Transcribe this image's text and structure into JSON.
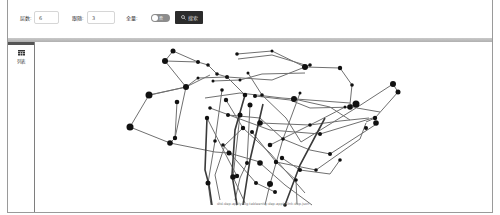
{
  "toolbar": {
    "depth_label": "层数:",
    "depth_value": "6",
    "follow_label": "跟随:",
    "follow_value": "3",
    "full_label": "全量:",
    "toggle_state": "off",
    "toggle_text": "否",
    "search_label": "搜索",
    "search_icon": "search-icon"
  },
  "sidebar": {
    "items": [
      {
        "label": "列表",
        "icon": "table-icon"
      }
    ]
  },
  "graph": {
    "type": "network",
    "node_color": "#111111",
    "edge_color": "#6e6e6e"
  },
  "footer": {
    "text": "dtd-dep-apply-log-tableenity-dep-apply-link-dep.json"
  }
}
